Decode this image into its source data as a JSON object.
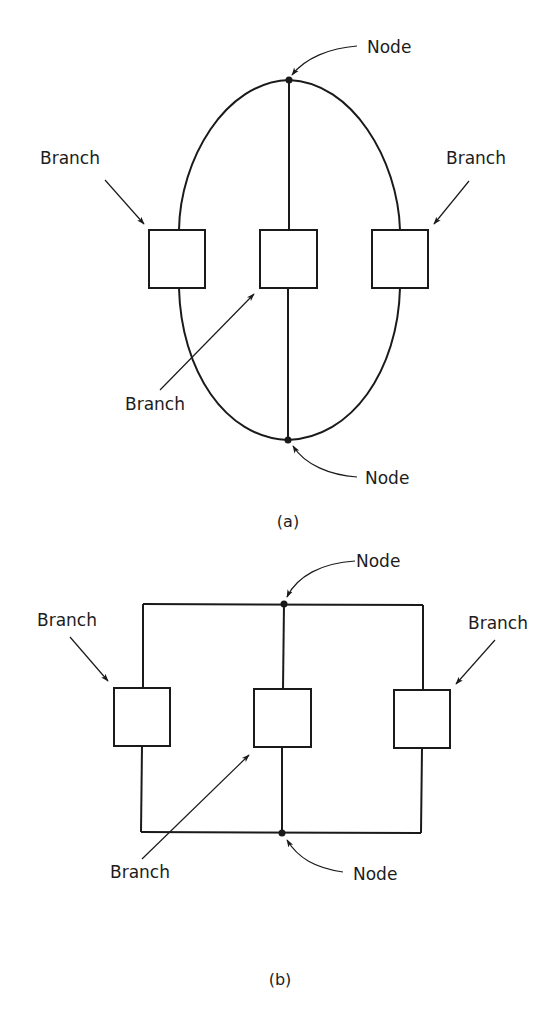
{
  "figure": {
    "diagram_a": {
      "caption": "(a)",
      "shape": "ellipse",
      "labels": {
        "node_top": "Node",
        "node_bottom": "Node",
        "branch_left": "Branch",
        "branch_right": "Branch",
        "branch_middle": "Branch"
      },
      "nodes": 2,
      "branches": 3
    },
    "diagram_b": {
      "caption": "(b)",
      "shape": "rectangular",
      "labels": {
        "node_top": "Node",
        "node_bottom": "Node",
        "branch_left": "Branch",
        "branch_right": "Branch",
        "branch_middle": "Branch"
      },
      "nodes": 2,
      "branches": 3
    }
  }
}
